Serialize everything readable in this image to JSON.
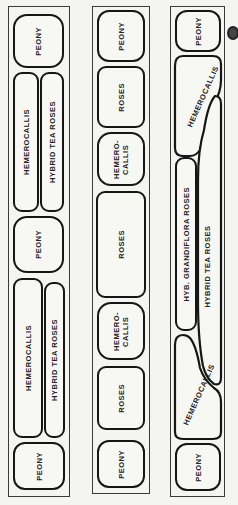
{
  "diagram": {
    "type": "garden-bed-plan",
    "panels": [
      {
        "beds": [
          {
            "label": "PEONY"
          },
          {
            "label": "HEMEROCALLIS"
          },
          {
            "label": "HYBRID TEA ROSES"
          },
          {
            "label": "PEONY"
          },
          {
            "label": "HEMEROCALLIS"
          },
          {
            "label": "HYBRID TEA ROSES"
          },
          {
            "label": "PEONY"
          }
        ]
      },
      {
        "beds": [
          {
            "label": "PEONY"
          },
          {
            "label": "ROSES"
          },
          {
            "label": "HEMERO-\nCALLIS"
          },
          {
            "label": "ROSES"
          },
          {
            "label": "HEMERO-\nCALLIS"
          },
          {
            "label": "ROSES"
          },
          {
            "label": "PEONY"
          }
        ]
      },
      {
        "beds": [
          {
            "label": "PEONY"
          },
          {
            "label": "HEMEROCALLIS"
          },
          {
            "label": "HYB. GRANDIFLORA ROSES"
          },
          {
            "label": "HYBRID TEA ROSES"
          },
          {
            "label": "HEMEROCALLIS"
          },
          {
            "label": "PEONY"
          }
        ]
      }
    ]
  }
}
